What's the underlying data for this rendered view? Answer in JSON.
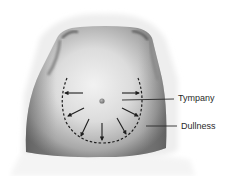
{
  "figure": {
    "labels": [
      {
        "id": "tympany",
        "text": "Tympany"
      },
      {
        "id": "dullness",
        "text": "Dullness"
      }
    ],
    "arrow_count": 8,
    "boundary_style": "dashed",
    "colors": {
      "background": "#ffffff",
      "skin_light": "#e6e6e6",
      "skin_dark": "#7a7a7a",
      "ink": "#1e1e1e"
    }
  }
}
